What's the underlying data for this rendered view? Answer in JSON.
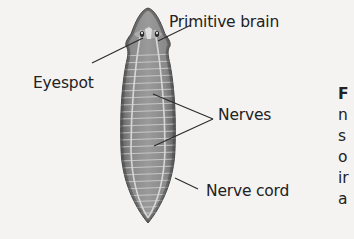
{
  "figure": {
    "labels": {
      "primitive_brain": "Primitive brain",
      "eyespot": "Eyespot",
      "nerves": "Nerves",
      "nerve_cord": "Nerve cord"
    },
    "colors": {
      "background": "#f4f3f1",
      "body_dark": "#6a6a6a",
      "body_mid": "#8c8c8c",
      "stripe_light": "#c9c9c9",
      "leader_line": "#2a2a2a",
      "text": "#222222"
    }
  },
  "caption_fragment": {
    "lines": [
      "F",
      "n",
      "s",
      "o",
      "ir",
      "a"
    ]
  }
}
